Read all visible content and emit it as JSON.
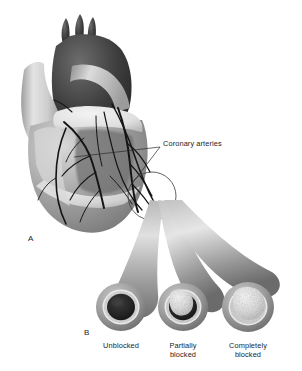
{
  "figure": {
    "background_color": "#ffffff",
    "text_color": "#1c1c1c"
  },
  "panels": [
    {
      "id": "A",
      "label": "A",
      "x": 28,
      "y": 238,
      "caption": "Heart with coronary arteries on its surface"
    },
    {
      "id": "B",
      "label": "B",
      "x": 84,
      "y": 330,
      "caption": "Cross sections of coronary artery"
    }
  ],
  "callouts": [
    {
      "name": "coronary-arteries-label",
      "text": "Coronary arteries",
      "x": 163,
      "y": 144,
      "leader_lines": [
        {
          "from_x": 161,
          "from_y": 147,
          "to_x": 74,
          "to_y": 157
        },
        {
          "from_x": 161,
          "from_y": 147,
          "to_x": 131,
          "to_y": 185
        }
      ]
    }
  ],
  "cross_sections": [
    {
      "name": "unblocked-artery",
      "label": "Unblocked",
      "label_lines": [
        "Unblocked"
      ],
      "center_x": 121,
      "center_y": 307,
      "outer_radius": 25,
      "lumen_radius": 14,
      "plaque_coverage_percent": 0,
      "lumen_color": "#2b2b2b",
      "wall_color": "#9a9a9a",
      "plaque_color": "#e8e8e8",
      "label_x": 121,
      "label_y": 345
    },
    {
      "name": "partially-blocked-artery",
      "label": "Partially blocked",
      "label_lines": [
        "Partially",
        "blocked"
      ],
      "center_x": 183,
      "center_y": 307,
      "outer_radius": 25,
      "lumen_radius": 14,
      "plaque_coverage_percent": 55,
      "lumen_color": "#2b2b2b",
      "wall_color": "#9a9a9a",
      "plaque_color": "#e3e3e3",
      "label_x": 183,
      "label_y": 345
    },
    {
      "name": "completely-blocked-artery",
      "label": "Completely blocked",
      "label_lines": [
        "Completely",
        "blocked"
      ],
      "center_x": 248,
      "center_y": 307,
      "outer_radius": 26,
      "lumen_radius": 16,
      "plaque_coverage_percent": 100,
      "lumen_color": "#2b2b2b",
      "wall_color": "#9a9a9a",
      "plaque_color": "#e3e3e3",
      "label_x": 248,
      "label_y": 345
    }
  ],
  "anatomy": {
    "aorta_color": "#3a3a3a",
    "great_vessel_color": "#c9c9c9",
    "ventricle_color": "#8e8e8e",
    "fat_color": "#ededed",
    "artery_line_color": "#1a1a1a",
    "highlight_circle": {
      "cx": 152,
      "cy": 196,
      "r": 24
    }
  }
}
